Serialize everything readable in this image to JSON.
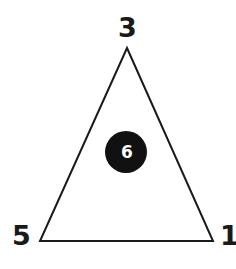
{
  "figure": {
    "kind": "triangle-node-diagram",
    "background_color": "#ffffff",
    "stroke_color": "#1a1a1a",
    "node_fill_color": "#111111",
    "node_text_color": "#ffffff"
  },
  "triangle": {
    "name": "outline-triangle",
    "apex": {
      "x": 127,
      "y": 48
    },
    "bottom_left": {
      "x": 40,
      "y": 241
    },
    "bottom_right": {
      "x": 213,
      "y": 241
    },
    "stroke_width": 2
  },
  "vertex_labels": {
    "top": "3",
    "bottom_left": "5",
    "bottom_right": "1"
  },
  "center_node": {
    "label": "6",
    "cx": 126,
    "cy": 152,
    "r": 21
  }
}
